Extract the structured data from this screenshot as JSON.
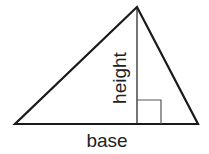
{
  "diagram": {
    "labels": {
      "height": "height",
      "base": "base"
    },
    "colors": {
      "stroke": "#1a1a1a",
      "right_angle_marker": "#555555",
      "background": "#ffffff"
    },
    "shapes": {
      "triangle": {
        "apex": [
          137,
          7
        ],
        "base_left": [
          15,
          124
        ],
        "base_right": [
          198,
          124
        ]
      },
      "height_line": {
        "x": 137,
        "y1": 7,
        "y2": 124
      },
      "right_angle_marker": {
        "x": 137,
        "y": 100,
        "size": 24
      }
    }
  }
}
